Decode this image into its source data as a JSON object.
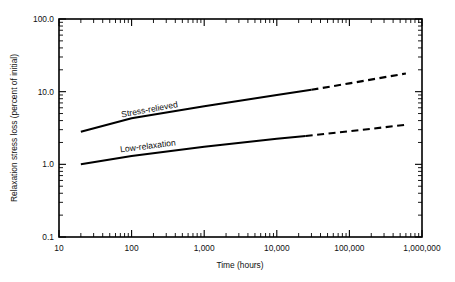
{
  "chart_data": {
    "type": "line",
    "title": "",
    "xlabel": "Time (hours)",
    "ylabel": "Relaxation stress loss (percent of initial)",
    "xscale": "log",
    "yscale": "log",
    "xlim": [
      10,
      1000000
    ],
    "ylim": [
      0.1,
      100.0
    ],
    "grid": false,
    "legend": "inline-curve-labels",
    "xticks": [
      10,
      100,
      1000,
      10000,
      100000,
      1000000
    ],
    "xtick_labels": [
      "10",
      "100",
      "1,000",
      "10,000",
      "100,000",
      "1,000,000"
    ],
    "yticks": [
      0.1,
      1.0,
      10.0,
      100.0
    ],
    "ytick_labels": [
      "0.1",
      "1.0",
      "10.0",
      "100.0"
    ],
    "minor_ticks": true,
    "series": [
      {
        "name": "Stress-relieved",
        "label": "Stress-relieved",
        "color": "#000000",
        "solid_points": [
          {
            "x": 20,
            "y": 2.8
          },
          {
            "x": 100,
            "y": 4.3
          },
          {
            "x": 1000,
            "y": 6.3
          },
          {
            "x": 10000,
            "y": 9.0
          },
          {
            "x": 30000,
            "y": 10.6
          }
        ],
        "dashed_points": [
          {
            "x": 30000,
            "y": 10.6
          },
          {
            "x": 100000,
            "y": 13.0
          },
          {
            "x": 600000,
            "y": 17.8
          }
        ]
      },
      {
        "name": "Low-relaxation",
        "label": "Low-relaxation",
        "color": "#000000",
        "solid_points": [
          {
            "x": 20,
            "y": 1.0
          },
          {
            "x": 100,
            "y": 1.3
          },
          {
            "x": 1000,
            "y": 1.75
          },
          {
            "x": 10000,
            "y": 2.25
          },
          {
            "x": 25000,
            "y": 2.45
          }
        ],
        "dashed_points": [
          {
            "x": 25000,
            "y": 2.45
          },
          {
            "x": 100000,
            "y": 2.85
          },
          {
            "x": 600000,
            "y": 3.5
          }
        ]
      }
    ]
  },
  "colors": {
    "ink": "#000000",
    "background": "#ffffff"
  }
}
